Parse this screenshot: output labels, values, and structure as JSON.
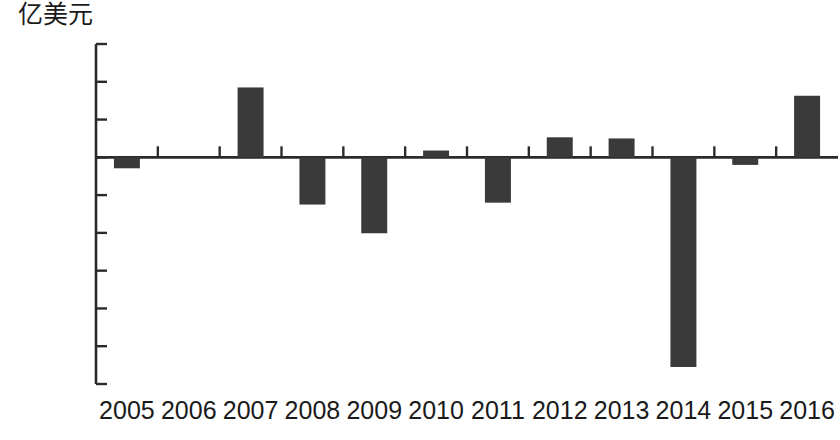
{
  "chart_data": {
    "type": "bar",
    "title": "",
    "subtitle": "",
    "xlabel": "",
    "ylabel": "亿美元",
    "unit_label": "亿美元",
    "categories": [
      "2005",
      "2006",
      "2007",
      "2008",
      "2009",
      "2010",
      "2011",
      "2012",
      "2013",
      "2014",
      "2015",
      "2016"
    ],
    "values": [
      -290,
      0,
      1850,
      -1250,
      -2010,
      180,
      -1200,
      530,
      500,
      -5550,
      -200,
      1630
    ],
    "series": [
      {
        "name": "亿美元",
        "values": [
          -290,
          0,
          1850,
          -1250,
          -2010,
          180,
          -1200,
          530,
          500,
          -5550,
          -200,
          1630
        ]
      }
    ],
    "ylim": [
      -6000,
      3000
    ],
    "ytick_values": [
      3000,
      2000,
      1000,
      0,
      -1000,
      -2000,
      -3000,
      -4000,
      -5000,
      -6000
    ],
    "ytick_labels": [
      "3000",
      "2000",
      "1000",
      "0",
      "−1000",
      "−2000",
      "−3000",
      "−4000",
      "−5000",
      "−6000"
    ],
    "grid": false,
    "legend": "none",
    "bar_color": "#3a3a3a",
    "axis_color": "#2b2b2b",
    "zero_line": 0
  }
}
